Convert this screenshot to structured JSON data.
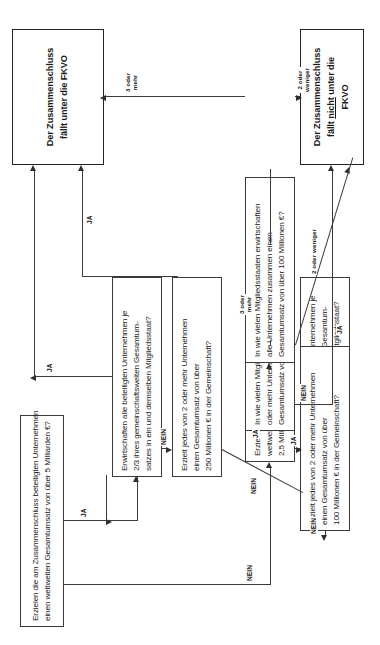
{
  "diagram": {
    "nodes": {
      "q1": {
        "lines": [
          "Erzielen die am Zusammenschluss beteiligten Unternehmen",
          "einen weltweiten Gesamtumsatz von über 5 Milliarden €?"
        ]
      },
      "q2": {
        "lines": [
          "Erzielen alle Unternehmen zusammen einen",
          "weltweiten Gesamtumsatz von über",
          "2,5 Milliarden €?"
        ]
      },
      "q3": {
        "lines": [
          "Erwirtschaften alle beteiligten Unternehmen je",
          "2/3 ihres gemeinschaftsweiten Gesamtum-",
          "satzes in ein und demselben Mitgliedsstaat?"
        ]
      },
      "q4": {
        "lines": [
          "Erzielt jedes von 2 oder mehr Unternehmen",
          "einen Gesamtumsatz von über",
          "100 Millionen € in der Gemeinschaft?"
        ]
      },
      "q5": {
        "lines": [
          "Erwirtschaften alle beteiligten Unternehmen je",
          "2/3 ihres gemeinschaftsweiten Gesamtum-",
          "satzes in ein und demselben Mitgliedsstaat?"
        ]
      },
      "q6": {
        "lines": [
          "Erzielt jedes von 2 oder mehr Unternehmen",
          "einen Gesamtumsatz von über",
          "250 Millionen € in der Gemeinschaft?"
        ]
      },
      "q7": {
        "lines": [
          "In wie vielen Mitgliedsstaaten erwirtschaften 2",
          "oder mehr Unternehmen je einen",
          "Gesamtumsatz von über 25 Millionen €?"
        ]
      },
      "q8": {
        "lines": [
          "In wie vielen Mitgliedsstaaten erwirtschaften",
          "alle Unternehmen zusammen einen",
          "Gesamtumsatz von über 100 Millionen €?"
        ]
      },
      "result_yes": {
        "lines": [
          "Der Zusammenschluss",
          "fällt unter die FKVO"
        ]
      },
      "result_no": {
        "line1": "Der Zusammenschluss",
        "line2_a": "fällt ",
        "line2_underlined": "nicht",
        "line2_b": " unter die",
        "line3": "FKVO"
      }
    },
    "edge_labels": {
      "q1_ja": "JA",
      "q1_nein": "NEIN",
      "q2_ja": "JA",
      "q2_nein": "NEIN",
      "q3_ja": "JA",
      "q3_nein": "NEIN",
      "q4_ja": "JA",
      "q4_nein": "NEIN",
      "q5_ja": "JA",
      "q5_nein": "NEIN",
      "q6_ja": "JA",
      "q6_nein": "NEIN",
      "q7_three_or_more": "3 oder\nmehr",
      "q7_two_or_fewer": "2 oder weniger",
      "q8_three_or_more": "3 oder\nmehr",
      "q8_two_or_fewer": "2 oder\nweniger"
    }
  }
}
